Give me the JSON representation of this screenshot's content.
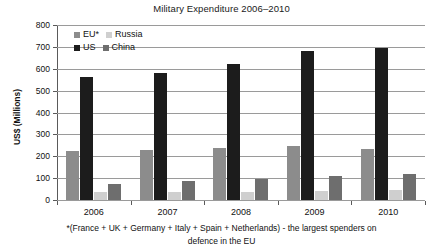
{
  "chart_data": {
    "type": "bar",
    "title": "Military Expenditure 2006–2010",
    "xlabel": "",
    "ylabel": "US$ (Millions)",
    "ylim": [
      0,
      800
    ],
    "ytick_step": 100,
    "grid": true,
    "legend_position": "top-left-inside",
    "categories": [
      "2006",
      "2007",
      "2008",
      "2009",
      "2010"
    ],
    "ytick_labels": [
      "800",
      "700",
      "600",
      "500",
      "400",
      "300",
      "200",
      "100",
      "0"
    ],
    "series": [
      {
        "name": "EU*",
        "color": "#8c8c8c",
        "values": [
          225,
          230,
          238,
          245,
          235
        ]
      },
      {
        "name": "US",
        "color": "#1c1c1c",
        "values": [
          562,
          580,
          620,
          680,
          695
        ]
      },
      {
        "name": "Russia",
        "color": "#cfcfcf",
        "values": [
          35,
          35,
          38,
          40,
          45
        ]
      },
      {
        "name": "China",
        "color": "#6e6e6e",
        "values": [
          75,
          85,
          95,
          112,
          120
        ]
      }
    ],
    "annotations": [
      "*(France + UK + Germany + Italy + Spain + Netherlands) - the largest spenders on",
      "defence in the EU"
    ]
  },
  "legend": {
    "rows": [
      [
        {
          "label": "EU*",
          "color": "#8c8c8c"
        },
        {
          "label": "Russia",
          "color": "#cfcfcf"
        }
      ],
      [
        {
          "label": "US",
          "color": "#1c1c1c"
        },
        {
          "label": "China",
          "color": "#6e6e6e"
        }
      ]
    ]
  },
  "footnote": {
    "line1": "*(France + UK + Germany + Italy + Spain + Netherlands) - the largest spenders on",
    "line2": "defence in the EU"
  }
}
